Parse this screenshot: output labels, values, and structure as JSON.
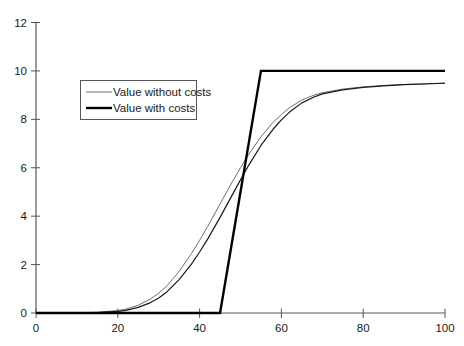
{
  "chart_data": {
    "type": "line",
    "title": "",
    "subtitle": "",
    "xlabel": "",
    "ylabel": "",
    "xlim": [
      0,
      100
    ],
    "ylim": [
      0,
      12
    ],
    "xticks": [
      0,
      20,
      40,
      60,
      80,
      100
    ],
    "yticks": [
      0,
      2,
      4,
      6,
      8,
      10,
      12
    ],
    "xtick_labels": [
      "0",
      "20",
      "40",
      "60",
      "80",
      "100"
    ],
    "ytick_labels": [
      "0",
      "2",
      "4",
      "6",
      "8",
      "10",
      "12"
    ],
    "grid": false,
    "legend_position": "upper-left-inside",
    "series": [
      {
        "name": "Value without costs",
        "style": "thin-gray-sigmoid",
        "color": "#6e6e6e",
        "width": 1.0,
        "x": [
          0,
          5,
          10,
          15,
          20,
          22,
          25,
          28,
          30,
          32,
          35,
          38,
          40,
          42,
          45,
          48,
          50,
          52,
          55,
          58,
          60,
          62,
          65,
          68,
          70,
          75,
          80,
          85,
          90,
          95,
          100
        ],
        "y": [
          0.0,
          0.0,
          0.01,
          0.03,
          0.1,
          0.16,
          0.32,
          0.58,
          0.82,
          1.12,
          1.72,
          2.45,
          3.0,
          3.58,
          4.5,
          5.42,
          6.0,
          6.55,
          7.28,
          7.88,
          8.2,
          8.48,
          8.8,
          9.0,
          9.1,
          9.25,
          9.34,
          9.4,
          9.44,
          9.47,
          9.5
        ]
      },
      {
        "name": "Value with costs",
        "style": "thin-black-sigmoid",
        "color": "#1a1a1a",
        "width": 1.2,
        "x": [
          0,
          5,
          10,
          15,
          20,
          22,
          25,
          28,
          30,
          32,
          35,
          38,
          40,
          42,
          45,
          48,
          50,
          52,
          55,
          58,
          60,
          62,
          65,
          68,
          70,
          75,
          80,
          85,
          90,
          95,
          100
        ],
        "y": [
          0.0,
          0.0,
          0.0,
          0.02,
          0.07,
          0.11,
          0.23,
          0.43,
          0.62,
          0.87,
          1.38,
          2.02,
          2.52,
          3.06,
          3.95,
          4.88,
          5.5,
          6.1,
          6.92,
          7.6,
          7.98,
          8.3,
          8.68,
          8.92,
          9.05,
          9.22,
          9.32,
          9.38,
          9.43,
          9.46,
          9.49
        ]
      },
      {
        "name": "Value with costs (ramp)",
        "style": "thick-black-piecewise",
        "color": "#000000",
        "width": 2.4,
        "x": [
          0,
          45,
          55,
          100
        ],
        "y": [
          0,
          0,
          10,
          10
        ]
      }
    ],
    "annotations": []
  },
  "legend": {
    "entries": [
      {
        "label": "Value without costs",
        "swatch": "thin-gray-line"
      },
      {
        "label": "Value with costs",
        "swatch": "thick-black-line"
      }
    ],
    "border_color": "#555555",
    "background": "#ffffff"
  },
  "axes": {
    "axis_color": "#222222",
    "tick_color": "#555555",
    "x_axis_name": "x-axis",
    "y_axis_name": "y-axis"
  },
  "colors": {
    "background": "#ffffff",
    "series_gray": "#6e6e6e",
    "series_black": "#1a1a1a",
    "ramp_black": "#000000"
  }
}
